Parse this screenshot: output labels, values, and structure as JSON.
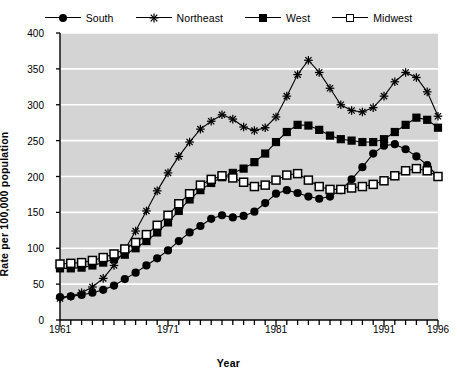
{
  "chart_data": {
    "type": "line",
    "title": "",
    "xlabel": "Year",
    "ylabel": "Rate per 100,000 population",
    "xlim": [
      1961,
      1996
    ],
    "ylim": [
      0,
      400
    ],
    "yticks": [
      0,
      50,
      100,
      150,
      200,
      250,
      300,
      350,
      400
    ],
    "xticks_labeled": [
      1961,
      1971,
      1981,
      1991,
      1996
    ],
    "xtick_interval": 1,
    "grid": "horizontal-white-gridlines-on-gray-panel",
    "legend_position": "top-center-outside",
    "panel_color": "#d4d4d4",
    "line_color": "#000000",
    "gridline_color": "#ffffff",
    "x": [
      1961,
      1962,
      1963,
      1964,
      1965,
      1966,
      1967,
      1968,
      1969,
      1970,
      1971,
      1972,
      1973,
      1974,
      1975,
      1976,
      1977,
      1978,
      1979,
      1980,
      1981,
      1982,
      1983,
      1984,
      1985,
      1986,
      1987,
      1988,
      1989,
      1990,
      1991,
      1992,
      1993,
      1994,
      1995,
      1996
    ],
    "series": [
      {
        "name": "South",
        "marker": "filled-circle",
        "values": [
          32,
          33,
          35,
          38,
          42,
          48,
          57,
          66,
          76,
          86,
          97,
          110,
          122,
          131,
          141,
          146,
          143,
          145,
          151,
          163,
          176,
          181,
          177,
          172,
          169,
          172,
          181,
          196,
          213,
          232,
          243,
          245,
          238,
          228,
          216,
          200
        ]
      },
      {
        "name": "Northeast",
        "marker": "asterisk",
        "values": [
          30,
          33,
          38,
          46,
          58,
          76,
          98,
          124,
          152,
          180,
          205,
          228,
          248,
          266,
          277,
          286,
          280,
          269,
          264,
          268,
          283,
          312,
          342,
          362,
          345,
          323,
          300,
          292,
          290,
          296,
          312,
          332,
          345,
          338,
          318,
          284
        ]
      },
      {
        "name": "West",
        "marker": "filled-square",
        "values": [
          72,
          72,
          73,
          76,
          80,
          85,
          91,
          100,
          110,
          122,
          136,
          152,
          168,
          181,
          191,
          199,
          205,
          211,
          220,
          232,
          248,
          262,
          272,
          271,
          265,
          257,
          252,
          250,
          248,
          248,
          252,
          262,
          272,
          282,
          279,
          268
        ]
      },
      {
        "name": "Midwest",
        "marker": "open-square",
        "values": [
          78,
          79,
          80,
          83,
          87,
          92,
          99,
          108,
          119,
          132,
          146,
          162,
          176,
          188,
          196,
          201,
          198,
          192,
          186,
          188,
          195,
          202,
          204,
          195,
          186,
          182,
          182,
          184,
          186,
          189,
          194,
          201,
          208,
          211,
          208,
          200
        ]
      }
    ]
  },
  "legend": {
    "items": [
      {
        "label": "South",
        "marker": "filled-circle"
      },
      {
        "label": "Northeast",
        "marker": "asterisk"
      },
      {
        "label": "West",
        "marker": "filled-square"
      },
      {
        "label": "Midwest",
        "marker": "open-square"
      }
    ]
  },
  "axes": {
    "ylabel": "Rate per 100,000 population",
    "xlabel": "Year",
    "ytick_labels": [
      "400",
      "350",
      "300",
      "250",
      "200",
      "150",
      "100",
      "50",
      "0"
    ],
    "xtick_labels": [
      "1961",
      "1971",
      "1981",
      "1991",
      "1996"
    ]
  },
  "icons": {
    "marker_asterisk": "✳"
  }
}
